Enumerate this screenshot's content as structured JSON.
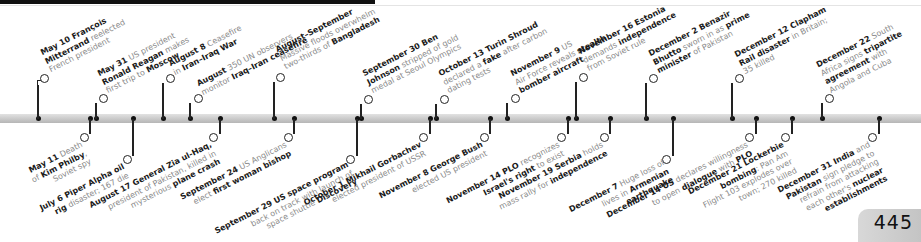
{
  "page": {
    "number": "445"
  },
  "timeline": {
    "above": [
      {
        "x": 38,
        "y": 76,
        "bold1": "May 10 François",
        "l2b": "Mitterrand",
        "l2": " reelected",
        "l3": "French president"
      },
      {
        "x": 97,
        "y": 97,
        "bold1": "May 31",
        "t1": " US president",
        "l2b": "Ronald Reagan",
        "l2": " makes",
        "l3": "first trip to ",
        "l3b": "Moscow"
      },
      {
        "x": 170,
        "y": 77,
        "bold1": "August 8",
        "t1": " Ceasefire",
        "l2": "in ",
        "l2b": "Iran–Iraq War"
      },
      {
        "x": 198,
        "y": 97,
        "bold1": "August",
        "t1": " 350 UN observers",
        "l2": "monitor ",
        "l2b": "Iraq–Iran ceasefire"
      },
      {
        "x": 275,
        "y": 72,
        "bold1": "August–September",
        "l2": "Massive floods overwhelm",
        "l3": "two-thirds of ",
        "l3b": "Bangladesh"
      },
      {
        "x": 369,
        "y": 97,
        "bold1": "September 30 Ben",
        "l2b": "Johnson",
        "l2": " stripped of gold",
        "l3": "medal at Seoul Olympics"
      },
      {
        "x": 444,
        "y": 97,
        "bold1": "October 13 Turin Shroud",
        "l2": "declared a ",
        "l2b": "fake",
        "l2c": " after carbon",
        "l3": "dating tests"
      },
      {
        "x": 515,
        "y": 96,
        "bold1": "November 9",
        "t1": " US",
        "l2": "Air Force reveals ",
        "l2b": "stealth",
        "l3b": "bomber aircraft"
      },
      {
        "x": 584,
        "y": 75,
        "bold1": "November 16 Estonia",
        "l2": "demands ",
        "l2b": "independence",
        "l3": "from Soviet rule"
      },
      {
        "x": 654,
        "y": 79,
        "bold1": "December 2 Benazir",
        "l2b": "Bhutto",
        "l2": " sworn in as ",
        "l2c_b": "prime",
        "l3b": "minister",
        "l3": " of Pakistan"
      },
      {
        "x": 741,
        "y": 79,
        "bold1": "December 12 Clapham",
        "l2b": "Rail disaster",
        "l2": " in Britain;",
        "l3": "35 killed"
      },
      {
        "x": 826,
        "y": 96,
        "bold1": "December 22",
        "t1": " South",
        "l2": "Africa signs ",
        "l2b": "tripartite",
        "l3b": "agreement",
        "l3": " with",
        "l4": "Angola and Cuba"
      }
    ],
    "below": [
      {
        "x": 80,
        "y": 143,
        "bold1": "May 11",
        "t1": " Death",
        "l2": "of ",
        "l2b": "Kim Philby",
        "l2c": ",",
        "l3": "Soviet spy"
      },
      {
        "x": 128,
        "y": 165,
        "bold1": "July 6 Piper Alpha oil",
        "l2b": "rig",
        "l2": " disaster; 167 die"
      },
      {
        "x": 214,
        "y": 142,
        "bold1": "August 17 General Zia ul-Haq,",
        "l2": "president of Pakistan, killed in",
        "l3": "mysterious ",
        "l3b": "plane crash"
      },
      {
        "x": 266,
        "y": 143,
        "bold1": "September 24",
        "t1": " US Anglicans",
        "l2": "elect ",
        "l2b": "first woman bishop"
      },
      {
        "x": 346,
        "y": 160,
        "bold1": "September 29 US space program",
        "l2": "back on track with launch of",
        "l3": "space shuttle ",
        "l3b": "Discovery"
      },
      {
        "x": 424,
        "y": 140,
        "bold1": "October 1 Mikhail Gorbachev",
        "l2": "elected president of USSR"
      },
      {
        "x": 496,
        "y": 140,
        "bold1": "November 8 George Bush",
        "l2": "elected US president"
      },
      {
        "x": 561,
        "y": 143,
        "bold1": "November 14 PLO",
        "t1": " recognizes",
        "l2b": "Israel's right",
        "l2": " to exist"
      },
      {
        "x": 606,
        "y": 141,
        "bold1": "November 19 Serbia",
        "t1": " holds",
        "l2": "mass rally for ",
        "l2b": "independence"
      },
      {
        "x": 665,
        "y": 160,
        "bold1": "December 7",
        "t1": " Huge loss of",
        "l2": "lives in ",
        "l2b": "Armenian",
        "l3b": "earthquake"
      },
      {
        "x": 742,
        "y": 141,
        "bold1": "December 14 US",
        "t1": " declares willingness",
        "l2": "to open ",
        "l2b": "dialogue",
        "l2c": " with ",
        "l2d_b": "PLO"
      },
      {
        "x": 781,
        "y": 141,
        "bold1": "December 21 Lockerbie",
        "l2b": "bombing",
        "l2": ": Pan Am",
        "l3": "Flight 103 explodes over",
        "l4": "town; 270 killed"
      },
      {
        "x": 866,
        "y": 141,
        "bold1": "December 31 India",
        "t1": " and",
        "l2b": "Pakistan",
        "l2": " sign pledge to",
        "l3": "refrain from attacking",
        "l4": "each other's ",
        "l4b": "nuclear",
        "l5b": "establishments"
      }
    ]
  }
}
